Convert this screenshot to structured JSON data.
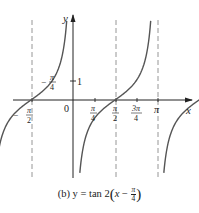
{
  "chart_data": {
    "type": "line",
    "function": "y = tan(2(x - pi/4))",
    "xlabel": "x",
    "ylabel": "y",
    "x_ticks": [
      {
        "value": -1.5708,
        "label": "−π/2"
      },
      {
        "value": -0.7854,
        "label": "−π/4"
      },
      {
        "value": 0,
        "label": "0"
      },
      {
        "value": 0.7854,
        "label": "π/4"
      },
      {
        "value": 1.5708,
        "label": "π/2"
      },
      {
        "value": 2.3562,
        "label": "3π/4"
      },
      {
        "value": 3.1416,
        "label": "π"
      }
    ],
    "y_ticks": [
      {
        "value": 1,
        "label": "1"
      }
    ],
    "asymptotes_x": [
      -1.5708,
      1.5708,
      3.1416
    ],
    "zeros_x": [
      -0.7854,
      0.7854,
      2.3562
    ],
    "branches": [
      {
        "x_range": [
          -1.5708,
          0
        ],
        "zero": -0.7854
      },
      {
        "x_range": [
          0,
          1.5708
        ],
        "zero": 0.7854
      },
      {
        "x_range": [
          1.5708,
          3.1416
        ],
        "zero": 2.3562
      }
    ],
    "xlim": [
      -1.95,
      3.7
    ],
    "ylim": [
      -4.1,
      4.4
    ],
    "grid": false,
    "legend": null
  },
  "labels": {
    "y_axis": "y",
    "x_axis": "x",
    "origin": "0",
    "one": "1",
    "neg_pi_over_4_num": "π",
    "neg_pi_over_4_den": "4",
    "neg_pi_over_2_num": "π",
    "neg_pi_over_2_den": "2",
    "pi_over_4_num": "π",
    "pi_over_4_den": "4",
    "pi_over_2_num": "π",
    "pi_over_2_den": "2",
    "three_pi_over_4_num": "3π",
    "three_pi_over_4_den": "4",
    "pi": "π",
    "minus": "−"
  },
  "caption": {
    "prefix": "(b) y = tan 2",
    "x": "x",
    "minus": " − ",
    "num": "π",
    "den": "4"
  },
  "colors": {
    "curve": "#555555",
    "axis": "#222222",
    "asymptote": "#888888"
  }
}
